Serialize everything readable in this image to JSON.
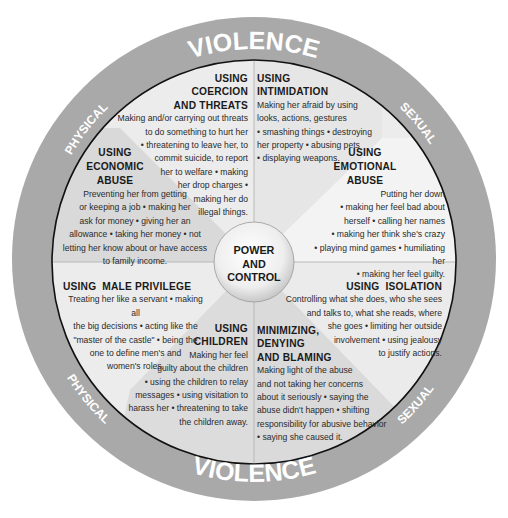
{
  "diagram": {
    "hub": {
      "label": "POWER\nAND\nCONTROL"
    },
    "outer_ring": {
      "top": {
        "left": "PHYSICAL",
        "center": "VIOLENCE",
        "right": "SEXUAL"
      },
      "bottom": {
        "left": "PHYSICAL",
        "center": "VIOLENCE",
        "right": "SEXUAL"
      }
    },
    "colors": {
      "outer_ring": "#a9a9a9",
      "sector_light": "#ececec",
      "sector_dark": "#d6d6d6",
      "hub": "#f4f4f4",
      "outline": "#111111",
      "ring_text": "#ffffff"
    },
    "sectors": [
      {
        "id": "coercion",
        "title": "USING\nCOERCION\nAND THREATS",
        "body": "Making and/or carrying out threats\nto do something to hurt her\n• threatening to leave her, to\ncommit suicide, to report\nher to welfare • making\nher drop charges •\nmaking her do\nillegal things."
      },
      {
        "id": "intimidation",
        "title": "USING\nINTIMIDATION",
        "body": "Making her afraid by using\nlooks, actions, gestures\n• smashing things • destroying\nher property • abusing pets\n• displaying weapons."
      },
      {
        "id": "emotional",
        "title": "USING\nEMOTIONAL\nABUSE",
        "body": "Putting her down\n• making her feel bad about\nherself • calling her names\n• making her think she's crazy\n• playing mind games • humiliating her\n• making her feel guilty."
      },
      {
        "id": "isolation",
        "title": "USING  ISOLATION",
        "body": "Controlling what she does, who she sees\nand talks to, what she reads, where\nshe goes • limiting her outside\ninvolvement • using jealousy\nto justify actions."
      },
      {
        "id": "minimizing",
        "title": "MINIMIZING,\nDENYING\nAND BLAMING",
        "body": "Making light of the abuse\nand not taking her concerns\nabout it seriously • saying the\nabuse didn't happen • shifting\nresponsibility for abusive behavior\n• saying she caused it."
      },
      {
        "id": "children",
        "title": "USING\nCHILDREN",
        "body": "Making her feel\nguilty about the children\n• using the children to relay\nmessages • using visitation to\nharass her • threatening to take\nthe children away."
      },
      {
        "id": "male_privilege",
        "title": "USING  MALE PRIVILEGE",
        "body": "Treating her like a servant • making all\nthe big decisions • acting like the\n\"master of the castle\" • being the\none to define men's and\nwomen's roles."
      },
      {
        "id": "economic",
        "title": "USING\nECONOMIC\nABUSE",
        "body": "Preventing her from getting\nor keeping a job • making her\nask for money • giving her an\nallowance • taking her money • not\nletting her know about or have access\nto family income."
      }
    ]
  }
}
